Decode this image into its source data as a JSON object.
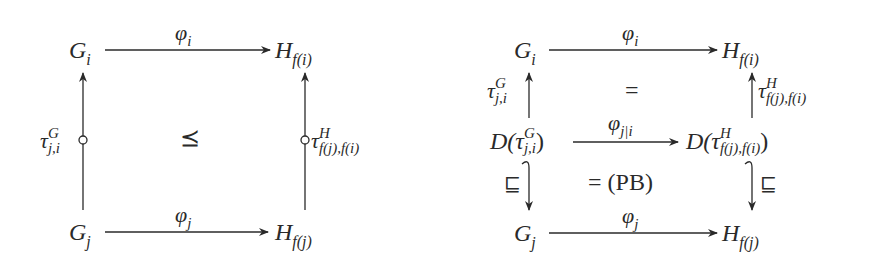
{
  "left_diagram": {
    "nodes": {
      "top_left": {
        "base": "G",
        "sub": "i"
      },
      "top_right": {
        "base": "H",
        "sub": "f(i)"
      },
      "bottom_left": {
        "base": "G",
        "sub": "j"
      },
      "bottom_right": {
        "base": "H",
        "sub": "f(j)"
      }
    },
    "arrows": {
      "top": {
        "base": "φ",
        "sub": "i"
      },
      "bottom": {
        "base": "φ",
        "sub": "j"
      },
      "left": {
        "base": "τ",
        "sup": "G",
        "sub": "j,i",
        "style": "partial (circle on shaft)"
      },
      "right": {
        "base": "τ",
        "sup": "H",
        "sub": "f(j),f(i)",
        "style": "partial (circle on shaft)"
      }
    },
    "center_relation": "⪯"
  },
  "right_diagram": {
    "nodes": {
      "top_left": {
        "base": "G",
        "sub": "i"
      },
      "top_right": {
        "base": "H",
        "sub": "f(i)"
      },
      "mid_left": {
        "prefix": "D(",
        "base": "τ",
        "sup": "G",
        "sub": "j,i",
        "suffix": ")"
      },
      "mid_right": {
        "prefix": "D(",
        "base": "τ",
        "sup": "H",
        "sub": "f(j),f(i)",
        "suffix": ")"
      },
      "bottom_left": {
        "base": "G",
        "sub": "j"
      },
      "bottom_right": {
        "base": "H",
        "sub": "f(j)"
      }
    },
    "arrows": {
      "top": {
        "base": "φ",
        "sub": "i"
      },
      "middle": {
        "base": "φ",
        "sub": "j|i"
      },
      "bottom": {
        "base": "φ",
        "sub": "j"
      },
      "upper_left": {
        "base": "τ",
        "sup": "G",
        "sub": "j,i"
      },
      "upper_right": {
        "base": "τ",
        "sup": "H",
        "sub": "f(j),f(i)"
      },
      "lower_left": {
        "label": "⊑",
        "style": "hooked inclusion"
      },
      "lower_right": {
        "label": "⊑",
        "style": "hooked inclusion"
      }
    },
    "upper_relation": "=",
    "lower_relation": "= (PB)"
  }
}
